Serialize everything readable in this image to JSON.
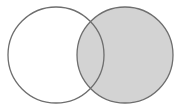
{
  "diagram": {
    "type": "venn",
    "sets": [
      {
        "id": "left",
        "cx": 56,
        "cy": 55,
        "r": 48,
        "fill": "#ffffff",
        "stroke": "#6e6e6e"
      },
      {
        "id": "right",
        "cx": 125,
        "cy": 55,
        "r": 48,
        "fill": "#d3d3d3",
        "stroke": "#6e6e6e"
      }
    ],
    "shaded_region": "right"
  }
}
